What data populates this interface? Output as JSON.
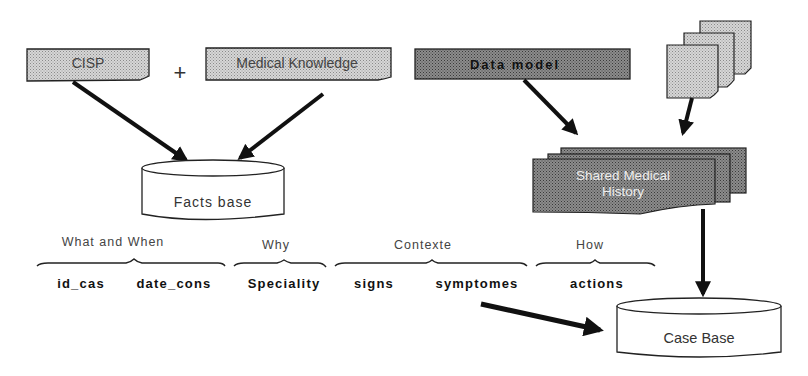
{
  "inputs": {
    "cisp": "CISP",
    "plus": "+",
    "medical_knowledge": "Medical Knowledge",
    "data_model": "Data model"
  },
  "stores": {
    "facts_base": "Facts base",
    "case_base": "Case Base",
    "shared_history_line1": "Shared Medical",
    "shared_history_line2": "History"
  },
  "groups": [
    {
      "header": "What and When",
      "fields": [
        "id_cas",
        "date_cons"
      ]
    },
    {
      "header": "Why",
      "fields": [
        "Speciality"
      ]
    },
    {
      "header": "Contexte",
      "fields": [
        "signs",
        "symptomes"
      ]
    },
    {
      "header": "How",
      "fields": [
        "actions"
      ]
    }
  ],
  "colors": {
    "light_fill": "#c8c8c8",
    "dark_fill": "#7a7a7a",
    "stroke": "#111111"
  }
}
